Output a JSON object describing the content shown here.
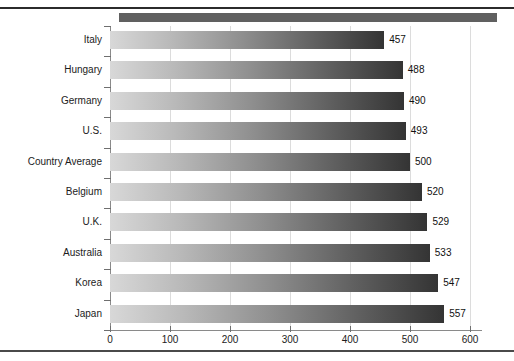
{
  "chart_data": {
    "type": "bar",
    "orientation": "horizontal",
    "title": "",
    "xlabel": "",
    "ylabel": "",
    "categories": [
      "Italy",
      "Hungary",
      "Germany",
      "U.S.",
      "Country Average",
      "Belgium",
      "U.K.",
      "Australia",
      "Korea",
      "Japan"
    ],
    "values": [
      457,
      488,
      490,
      493,
      500,
      520,
      529,
      533,
      547,
      557
    ],
    "value_labels": [
      "457",
      "488",
      "490",
      "493",
      "500",
      "520",
      "529",
      "533",
      "547",
      "557"
    ],
    "xlim": [
      0,
      620
    ],
    "xticks": [
      0,
      100,
      200,
      300,
      400,
      500,
      600
    ],
    "xtick_labels": [
      "0",
      "100",
      "200",
      "300",
      "400",
      "500",
      "600"
    ],
    "grid": true,
    "grid_axis": "x",
    "legend": null,
    "bar_gradient_start": "#d8d8d8",
    "bar_gradient_end": "#343434",
    "axis_color": "#8a8a8a",
    "grid_color": "#dcdcdc",
    "text_color": "#1c1c1c",
    "banner_color": "#606060",
    "rule_color": "#2b2b2b"
  }
}
